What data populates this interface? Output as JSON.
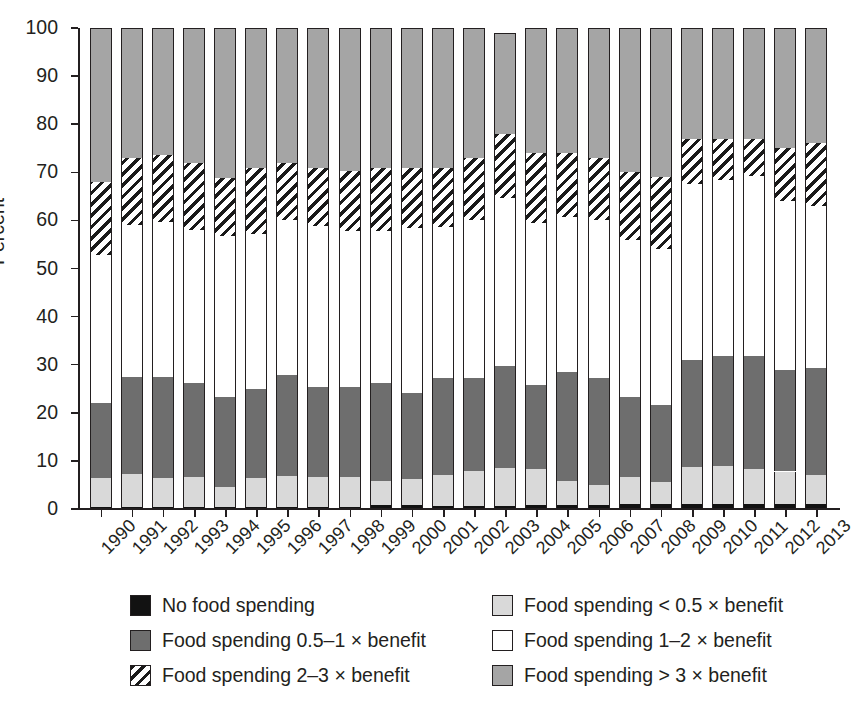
{
  "chart_data": {
    "type": "bar",
    "subtype": "stacked-bar-100",
    "title": "",
    "xlabel": "",
    "ylabel": "Percent",
    "ylim": [
      0,
      100
    ],
    "yticks": [
      0,
      10,
      20,
      30,
      40,
      50,
      60,
      70,
      80,
      90,
      100
    ],
    "grid": false,
    "legend_position": "bottom",
    "categories": [
      "1990",
      "1991",
      "1992",
      "1993",
      "1994",
      "1995",
      "1996",
      "1997",
      "1998",
      "1999",
      "2000",
      "2001",
      "2002",
      "2003",
      "2004",
      "2005",
      "2006",
      "2007",
      "2008",
      "2009",
      "2010",
      "2011",
      "2012",
      "2013"
    ],
    "series": [
      {
        "name": "No food spending",
        "key": "none",
        "color": "#121212",
        "pattern": "solid-black",
        "values": [
          0.5,
          0.4,
          0.4,
          0.4,
          0.4,
          0.4,
          0.4,
          0.4,
          0.4,
          0.8,
          0.8,
          0.7,
          0.7,
          0.7,
          0.9,
          0.9,
          0.9,
          1.0,
          1.0,
          1.1,
          1.1,
          1.1,
          1.0,
          1.0
        ]
      },
      {
        "name": "Food spending < 0.5 × benefit",
        "key": "lt_half",
        "color": "#d9d9d9",
        "pattern": "light-gray",
        "values": [
          6.0,
          6.8,
          6.0,
          6.2,
          4.2,
          6.1,
          6.4,
          6.3,
          6.2,
          5.0,
          5.4,
          6.4,
          7.3,
          7.8,
          7.5,
          4.9,
          4.0,
          5.7,
          4.7,
          7.6,
          7.8,
          7.3,
          6.8,
          6.0
        ]
      },
      {
        "name": "Food spending 0.5–1 × benefit",
        "key": "half_to_1",
        "color": "#6e6e6e",
        "pattern": "dark-gray",
        "values": [
          15.5,
          20.3,
          21.0,
          19.6,
          18.7,
          18.5,
          21.0,
          18.7,
          18.7,
          20.4,
          17.9,
          20.2,
          19.2,
          21.2,
          17.4,
          22.6,
          22.4,
          16.6,
          15.9,
          22.3,
          23.0,
          23.4,
          21.0,
          22.4
        ]
      },
      {
        "name": "Food spending 1–2 × benefit",
        "key": "1_to_2",
        "color": "#ffffff",
        "pattern": "white",
        "values": [
          30.8,
          31.6,
          32.2,
          31.9,
          33.5,
          32.2,
          32.2,
          33.5,
          32.5,
          31.7,
          34.3,
          31.4,
          32.8,
          35.0,
          33.7,
          32.4,
          32.8,
          32.7,
          32.5,
          36.5,
          36.4,
          37.5,
          35.3,
          33.5
        ]
      },
      {
        "name": "Food spending 2–3 × benefit",
        "key": "2_to_3",
        "color": "#ffffff",
        "pattern": "diagonal-hatch",
        "values": [
          15.2,
          13.8,
          13.9,
          13.9,
          12.1,
          13.8,
          12.0,
          12.1,
          12.5,
          13.1,
          12.6,
          12.3,
          13.0,
          13.3,
          14.5,
          13.2,
          12.8,
          14.0,
          14.9,
          9.5,
          8.7,
          7.7,
          10.9,
          13.1
        ]
      },
      {
        "name": "Food spending > 3 × benefit",
        "key": "gt_3",
        "color": "#a5a5a5",
        "pattern": "medium-gray",
        "values": [
          32.0,
          27.1,
          26.5,
          28.0,
          31.1,
          29.0,
          28.0,
          29.0,
          29.7,
          29.0,
          29.0,
          29.0,
          27.0,
          21.0,
          26.0,
          26.0,
          27.1,
          30.0,
          31.0,
          23.0,
          23.0,
          23.0,
          25.0,
          24.0
        ]
      }
    ]
  },
  "axis": {
    "ylabel": "Percent",
    "yticks": [
      "0",
      "10",
      "20",
      "30",
      "40",
      "50",
      "60",
      "70",
      "80",
      "90",
      "100"
    ]
  },
  "legend": {
    "left": [
      {
        "label": "No food spending",
        "swatch": "solid-black"
      },
      {
        "label": "Food spending 0.5–1 × benefit",
        "swatch": "dark-gray"
      },
      {
        "label": "Food spending 2–3 × benefit",
        "swatch": "diagonal-hatch"
      }
    ],
    "right": [
      {
        "label": "Food spending < 0.5 × benefit",
        "swatch": "light-gray"
      },
      {
        "label": "Food spending 1–2 × benefit",
        "swatch": "white"
      },
      {
        "label": "Food spending > 3 × benefit",
        "swatch": "medium-gray"
      }
    ]
  },
  "colors": {
    "none": "#121212",
    "lt_half": "#d9d9d9",
    "half_to_1": "#6e6e6e",
    "one_to_two": "#ffffff",
    "two_to_three": "#ffffff",
    "gt_three": "#a5a5a5",
    "axis": "#231f20"
  }
}
